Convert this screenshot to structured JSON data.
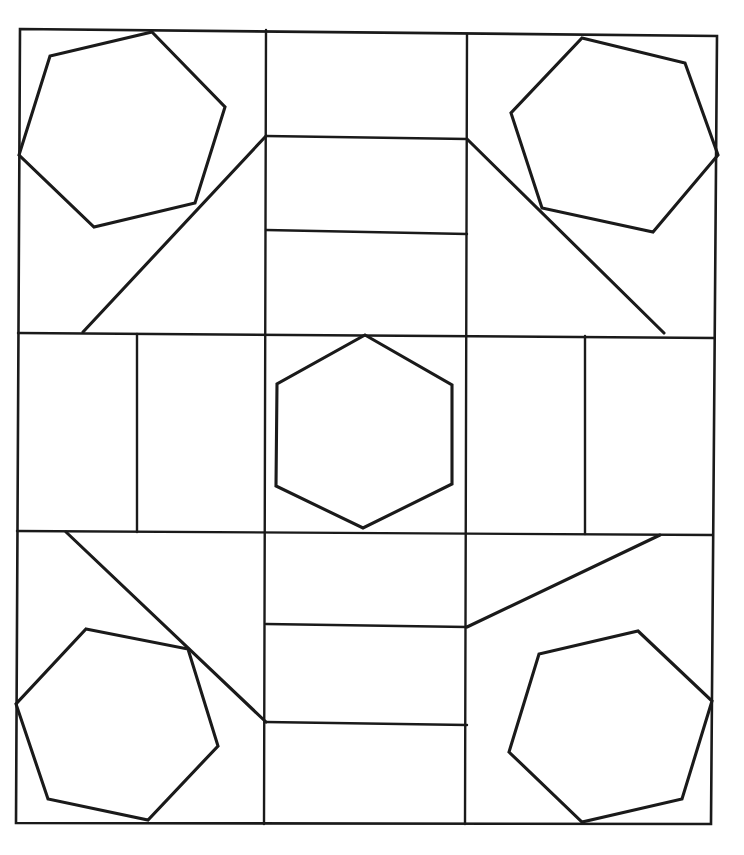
{
  "document": {
    "title": "Hexagon Quilt Block Line Drawing",
    "kind": "line-art-geometric-pattern",
    "background_color": "#ffffff",
    "stroke_color": "#1a1a1a",
    "canvas": {
      "width": 744,
      "height": 855
    }
  },
  "frame": {
    "name": "outer-border",
    "points": "20,29 717,36 711,824 16,823",
    "closed": true
  },
  "grid": {
    "description": "3x3 arrangement of cells formed by two horizontal and two vertical rules inside the outer border",
    "horizontal_rules": [
      {
        "name": "grid-h-upper",
        "points": "18,333 714,338"
      },
      {
        "name": "grid-h-lower",
        "points": "17,531 712,535"
      }
    ],
    "vertical_rules": [
      {
        "name": "grid-v-left",
        "points": "266,30 264,824"
      },
      {
        "name": "grid-v-right",
        "points": "467,34 465,824"
      }
    ]
  },
  "inner_rules": [
    {
      "name": "top-middle-bar-upper",
      "points": "266,136 467,139"
    },
    {
      "name": "top-middle-bar-lower",
      "points": "266,230 467,234"
    },
    {
      "name": "middle-left-divider",
      "points": "137,334 137,532"
    },
    {
      "name": "middle-right-divider",
      "points": "585,336 585,534"
    },
    {
      "name": "bottom-middle-bar-upper",
      "points": "266,624 467,627"
    },
    {
      "name": "bottom-middle-bar-lower",
      "points": "266,722 467,725"
    }
  ],
  "diagonals": [
    {
      "name": "diagonal-top-left",
      "points": "83,332 266,136"
    },
    {
      "name": "diagonal-top-right",
      "points": "467,139 664,333"
    },
    {
      "name": "diagonal-bottom-left",
      "points": "66,532 266,722"
    },
    {
      "name": "diagonal-bottom-right",
      "points": "467,627 660,535"
    }
  ],
  "hexagons": [
    {
      "name": "hexagon-top-left",
      "position": "top-left",
      "points": "152,32 225,107 195,203 94,227 19,155 50,56"
    },
    {
      "name": "hexagon-top-right",
      "position": "top-right",
      "points": "582,38 685,63 718,155 653,232 542,208 511,113"
    },
    {
      "name": "hexagon-center",
      "position": "center",
      "points": "365,335 452,385 452,484 363,528 276,486 277,384"
    },
    {
      "name": "hexagon-bottom-left",
      "position": "bottom-left",
      "points": "86,629 188,649 218,746 148,820 48,799 16,704"
    },
    {
      "name": "hexagon-bottom-right",
      "position": "bottom-right",
      "points": "638,631 712,701 682,799 582,822 509,752 539,654"
    }
  ],
  "caption": {
    "alt_text": "Black and white geometric line drawing: a square quilt block divided into a three by three grid, with a hexagon in each corner cell and one in the center cell, joined by diagonal and straight connecting lines.",
    "shape_count_label": "5 hexagons",
    "grid_label": "3 x 3 grid"
  }
}
